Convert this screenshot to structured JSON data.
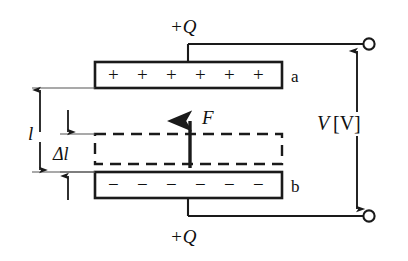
{
  "figure": {
    "background_color": "#ffffff",
    "stroke_color": "#1a1a1a",
    "text_color": "#101010"
  },
  "labels": {
    "charge_top": "+Q",
    "charge_bottom": "+Q",
    "plate_a": "a",
    "plate_b": "b",
    "force": "F",
    "gap_total": "l",
    "gap_delta": "Δl",
    "voltage_symbol": "V",
    "voltage_unit": "[V]"
  },
  "plates": {
    "top": {
      "name": "a",
      "polarity": "positive",
      "symbol": "+",
      "count": 6,
      "x": 95,
      "y": 62,
      "width": 187,
      "height": 26
    },
    "bottom": {
      "name": "b",
      "polarity": "negative",
      "symbol": "−",
      "count": 6,
      "x": 95,
      "y": 172,
      "width": 187,
      "height": 26
    }
  },
  "slab": {
    "name": "dielectric-slab",
    "style": "dashed",
    "x": 95,
    "y": 134,
    "width": 187,
    "height": 30
  },
  "force_arrow": {
    "label": "F",
    "direction": "up",
    "x": 190,
    "y_tail": 168,
    "y_head": 116
  },
  "dimensions": [
    {
      "key": "gap_total",
      "label": "l",
      "x": 40,
      "y_top": 88,
      "y_bottom": 180
    },
    {
      "key": "gap_delta",
      "label": "Δl",
      "x": 68,
      "y_top": 110,
      "y_bottom": 200
    }
  ],
  "circuit": {
    "terminal_top": {
      "cx": 368,
      "cy": 44,
      "r": 6
    },
    "terminal_bottom": {
      "cx": 368,
      "cy": 216,
      "r": 6
    },
    "wire_top_x": 188,
    "wire_bottom_x": 188,
    "bus_x": 357,
    "voltage_label_x": 322,
    "voltage_label_y": 122
  }
}
